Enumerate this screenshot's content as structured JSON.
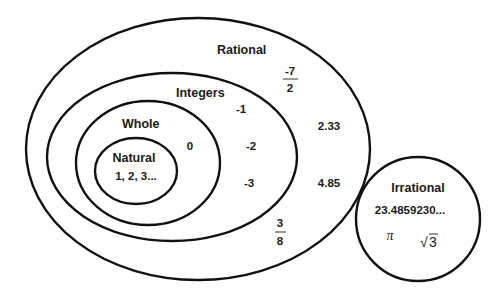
{
  "diagram": {
    "sets": {
      "rational": {
        "label": "Rational",
        "examples": {
          "fraction_neg7_2": {
            "numerator": "-7",
            "denominator": "2"
          },
          "decimal_1": "2.33",
          "decimal_2": "4.85",
          "fraction_3_8": {
            "numerator": "3",
            "denominator": "8"
          }
        }
      },
      "integers": {
        "label": "Integers",
        "examples": [
          "-1",
          "-2",
          "-3"
        ]
      },
      "whole": {
        "label": "Whole",
        "examples": [
          "0"
        ]
      },
      "natural": {
        "label": "Natural",
        "examples": "1, 2, 3..."
      },
      "irrational": {
        "label": "Irrational",
        "examples": {
          "decimal": "23.4859230...",
          "pi": "π",
          "sqrt_symbol": "√",
          "sqrt_value": "3"
        }
      }
    },
    "colors": {
      "stroke": "#111111",
      "text": "#1a1a1a",
      "background": "#ffffff"
    }
  }
}
